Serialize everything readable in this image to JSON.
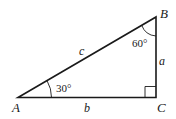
{
  "diagram": {
    "type": "right-triangle",
    "vertices": {
      "A": "A",
      "B": "B",
      "C": "C"
    },
    "sides": {
      "a": "a",
      "b": "b",
      "c": "c"
    },
    "angles": {
      "A": "30°",
      "B": "60°"
    },
    "right_angle_at": "C",
    "stroke_color": "#1a1a1a",
    "background": "#ffffff"
  }
}
